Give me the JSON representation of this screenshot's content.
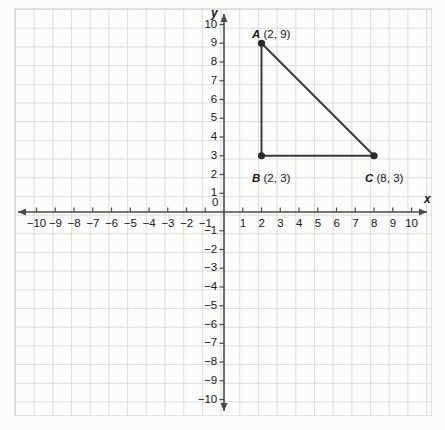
{
  "figure": {
    "type": "coordinate-plane-triangle",
    "background_color": "#fcfcfb",
    "grid_color": "#d8d8d8",
    "axis_color": "#4a4a4a",
    "shape_color": "#3a3a3a"
  },
  "axes": {
    "x_label": "x",
    "y_label": "y",
    "origin_label": "0",
    "x_ticks": [
      "-10",
      "-9",
      "-8",
      "-7",
      "-6",
      "-5",
      "-4",
      "-3",
      "-2",
      "-1",
      "1",
      "2",
      "3",
      "4",
      "5",
      "6",
      "7",
      "8",
      "9",
      "10"
    ],
    "y_ticks": [
      "10",
      "9",
      "8",
      "7",
      "6",
      "5",
      "4",
      "3",
      "2",
      "1",
      "-1",
      "-2",
      "-3",
      "-4",
      "-5",
      "-6",
      "-7",
      "-8",
      "-9",
      "-10"
    ]
  },
  "chart_data": {
    "type": "scatter",
    "title": "",
    "xlabel": "x",
    "ylabel": "y",
    "xlim": [
      -10,
      10
    ],
    "ylim": [
      -10,
      10
    ],
    "grid": true,
    "legend": "none",
    "x_ticks": [
      -10,
      -9,
      -8,
      -7,
      -6,
      -5,
      -4,
      -3,
      -2,
      -1,
      0,
      1,
      2,
      3,
      4,
      5,
      6,
      7,
      8,
      9,
      10
    ],
    "y_ticks": [
      -10,
      -9,
      -8,
      -7,
      -6,
      -5,
      -4,
      -3,
      -2,
      -1,
      0,
      1,
      2,
      3,
      4,
      5,
      6,
      7,
      8,
      9,
      10
    ],
    "points": [
      {
        "name": "A",
        "x": 2,
        "y": 9,
        "label": "A (2, 9)"
      },
      {
        "name": "B",
        "x": 2,
        "y": 3,
        "label": "B (2, 3)"
      },
      {
        "name": "C",
        "x": 8,
        "y": 3,
        "label": "C (8, 3)"
      }
    ],
    "segments": [
      {
        "from": "A",
        "to": "B"
      },
      {
        "from": "B",
        "to": "C"
      },
      {
        "from": "C",
        "to": "A"
      }
    ],
    "annotations": [
      {
        "text": "A (2, 9)",
        "x": 2,
        "y": 9
      },
      {
        "text": "B (2, 3)",
        "x": 2,
        "y": 3
      },
      {
        "text": "C (8, 3)",
        "x": 8,
        "y": 3
      }
    ]
  },
  "labels": {
    "a_point": "A (2, 9)",
    "a_name": "A",
    "a_coords": "(2, 9)",
    "b_point": "B (2, 3)",
    "b_name": "B",
    "b_coords": "(2, 3)",
    "c_point": "C (8, 3)",
    "c_name": "C",
    "c_coords": "(8, 3)"
  }
}
